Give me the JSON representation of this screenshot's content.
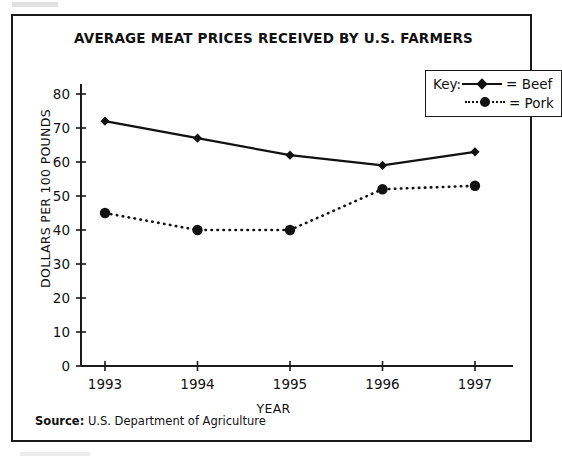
{
  "chart_data": {
    "type": "line",
    "title": "AVERAGE MEAT PRICES RECEIVED BY U.S. FARMERS",
    "xlabel": "YEAR",
    "ylabel": "DOLLARS PER 100 POUNDS",
    "categories": [
      "1993",
      "1994",
      "1995",
      "1996",
      "1997"
    ],
    "x": [
      1993,
      1994,
      1995,
      1996,
      1997
    ],
    "ylim": [
      0,
      80
    ],
    "yticks": [
      0,
      10,
      20,
      30,
      40,
      50,
      60,
      70,
      80
    ],
    "ytick_labels": [
      "0",
      "10",
      "20",
      "30",
      "40",
      "50",
      "60",
      "70",
      "80"
    ],
    "grid": false,
    "legend_position": "top-right",
    "legend_prefix": "Key:",
    "series": [
      {
        "name": "Beef",
        "legend_label": "= Beef",
        "marker": "diamond",
        "linestyle": "solid",
        "color": "#111111",
        "values": [
          72,
          67,
          62,
          59,
          63
        ]
      },
      {
        "name": "Pork",
        "legend_label": "= Pork",
        "marker": "circle",
        "linestyle": "dotted",
        "color": "#111111",
        "values": [
          45,
          40,
          40,
          52,
          53
        ]
      }
    ]
  },
  "source": {
    "label": "Source:",
    "text": "U.S. Department of Agriculture"
  }
}
